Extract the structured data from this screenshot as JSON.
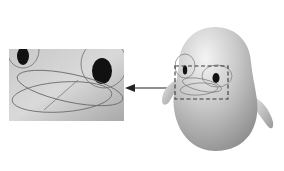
{
  "figure": {
    "background_color": "#ffffff",
    "colors": {
      "body_light": "#e6e6e6",
      "body_mid": "#bdbdbd",
      "body_dark": "#8c8c8c",
      "eye": "#111111",
      "outline_curve": "#6e6e6e",
      "dashed_box": "#3a3a3a",
      "arrow": "#222222",
      "inset_light": "#d6d6d6",
      "inset_dark": "#a9a9a9"
    },
    "inset": {
      "x": 9,
      "y": 49,
      "width": 115,
      "height": 72
    },
    "selection_box": {
      "x": 175,
      "y": 66,
      "width": 53,
      "height": 33,
      "style": "dashed"
    },
    "arrow": {
      "from": [
        174,
        88
      ],
      "to": [
        126,
        88
      ]
    },
    "character": {
      "body_bounds": [
        173,
        27,
        258,
        151
      ]
    }
  }
}
